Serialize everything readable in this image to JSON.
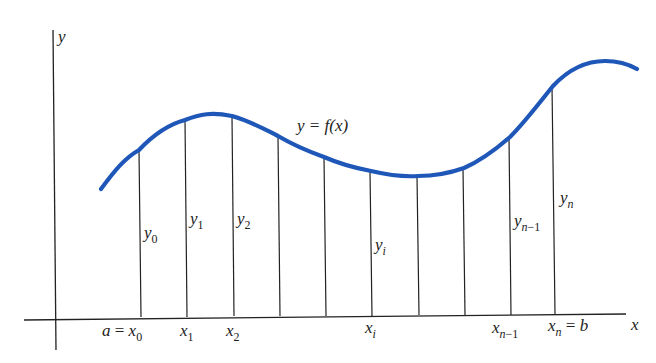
{
  "diagram": {
    "curve_label": "y = f(x)",
    "curve_color": "#1f57b8",
    "line_color": "#222222",
    "axes": {
      "x_label": "x",
      "y_label": "y"
    },
    "ordinates": [
      {
        "id": "y0",
        "base": "y",
        "sub": "0",
        "x": 140,
        "top": 150
      },
      {
        "id": "y1",
        "base": "y",
        "sub": "1",
        "x": 186,
        "top": 120
      },
      {
        "id": "y2",
        "base": "y",
        "sub": "2",
        "x": 233,
        "top": 116
      },
      {
        "id": "y3",
        "base": "",
        "sub": "",
        "x": 279,
        "top": 136
      },
      {
        "id": "y4",
        "base": "",
        "sub": "",
        "x": 325,
        "top": 157
      },
      {
        "id": "yi",
        "base": "y",
        "sub": "i",
        "x": 371,
        "top": 171
      },
      {
        "id": "y6",
        "base": "",
        "sub": "",
        "x": 418,
        "top": 176
      },
      {
        "id": "y7",
        "base": "",
        "sub": "",
        "x": 464,
        "top": 168
      },
      {
        "id": "yn1",
        "base": "y",
        "sub": "n − 1",
        "x": 510,
        "top": 137
      },
      {
        "id": "yn",
        "base": "y",
        "sub": "n",
        "x": 556,
        "top": 86
      }
    ],
    "x_ticks": [
      {
        "id": "x0",
        "prefix": "a = ",
        "base": "x",
        "sub": "0"
      },
      {
        "id": "x1",
        "prefix": "",
        "base": "x",
        "sub": "1"
      },
      {
        "id": "x2",
        "prefix": "",
        "base": "x",
        "sub": "2"
      },
      {
        "id": "xi",
        "prefix": "",
        "base": "x",
        "sub": "i"
      },
      {
        "id": "xn1",
        "prefix": "",
        "base": "x",
        "sub": "n − 1"
      },
      {
        "id": "xn",
        "prefix": "",
        "base": "x",
        "sub": "n",
        "suffix": " = b"
      }
    ]
  }
}
